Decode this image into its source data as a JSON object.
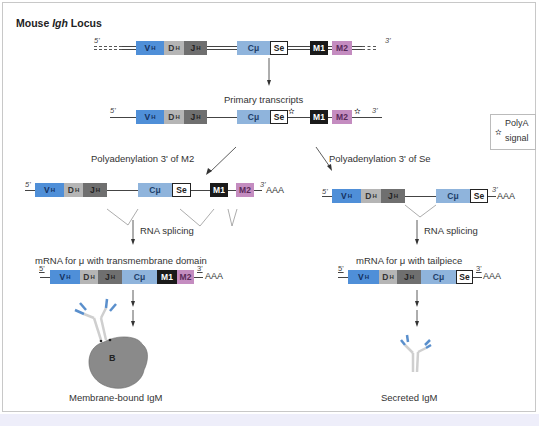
{
  "title": {
    "prefix": "Mouse ",
    "italic": "Igh",
    "suffix": " Locus"
  },
  "labels": {
    "primary_transcripts": "Primary transcripts",
    "polya_m2": "Polyadenylation 3' of M2",
    "polya_se": "Polyadenylation 3' of Se",
    "rna_splicing_left": "RNA splicing",
    "rna_splicing_right": "RNA splicing",
    "mrna_tm": "mRNA for μ with transmembrane domain",
    "mrna_tail": "mRNA for μ with tailpiece",
    "membrane_igm": "Membrane-bound IgM",
    "secreted_igm": "Secreted IgM",
    "cell_label": "B"
  },
  "legend": {
    "icon": "star-icon",
    "symbol": "✫",
    "line1": "PolyA",
    "line2": "signal"
  },
  "primes": {
    "five": "5'",
    "three": "3'"
  },
  "poly_a_tail": "AAA",
  "segments": {
    "vh": {
      "main": "V",
      "sub": "H"
    },
    "dh": {
      "main": "D",
      "sub": "H"
    },
    "jh": {
      "main": "J",
      "sub": "H"
    },
    "cmu": "Cμ",
    "se": "Se",
    "m1": "M1",
    "m2": "M2"
  },
  "colors": {
    "vh": "#4f8fd8",
    "dh": "#b5b5b5",
    "jh": "#6f6f6f",
    "cmu": "#8fb4dc",
    "m1": "#1a1a1a",
    "m2": "#c48cc0",
    "cell": "#8a8a8a"
  }
}
